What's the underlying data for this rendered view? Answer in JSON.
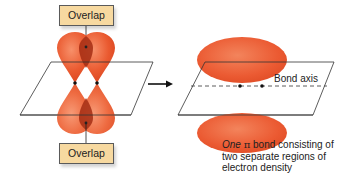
{
  "figure": {
    "left_panel": {
      "top_label": "Overlap",
      "bottom_label": "Overlap"
    },
    "arrow": "right-arrow",
    "right_panel": {
      "axis_label": "Bond axis",
      "caption": {
        "italic_word": "One",
        "symbol": "π",
        "line1_rest": "bond consisting of",
        "line2": "two separate regions of",
        "line3": "electron density"
      }
    },
    "colors": {
      "lobe": "#e8502a",
      "lobe_highlight": "#f58a5e",
      "overlap": "#9c2a12",
      "label_fill": "#f7d9a0",
      "plane_line": "#333333"
    }
  }
}
